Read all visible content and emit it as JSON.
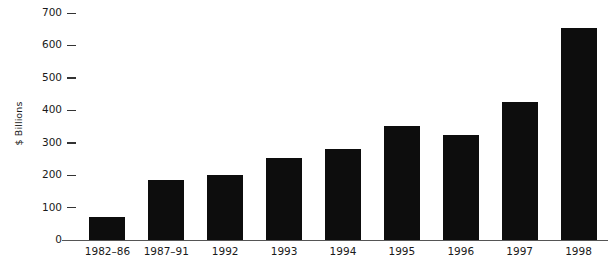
{
  "chart_data": {
    "type": "bar",
    "title": "",
    "xlabel": "",
    "ylabel": "$ Billions",
    "categories": [
      "1982–86",
      "1987–91",
      "1992",
      "1993",
      "1994",
      "1995",
      "1996",
      "1997",
      "1998"
    ],
    "values": [
      70,
      185,
      200,
      253,
      280,
      353,
      325,
      425,
      655
    ],
    "ylim": [
      0,
      700
    ],
    "yticks": [
      0,
      100,
      200,
      300,
      400,
      500,
      600,
      700
    ],
    "ytick_labels": [
      "0",
      "100",
      "200",
      "300",
      "400",
      "500",
      "600",
      "700"
    ],
    "grid": false,
    "legend": null,
    "bar_color": "#0d0d0d",
    "axis_color": "#555555",
    "background_color": "#ffffff"
  }
}
